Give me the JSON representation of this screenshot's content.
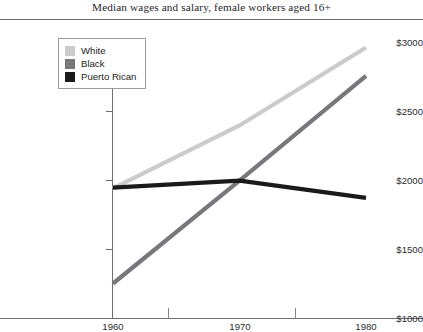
{
  "chart_data": {
    "type": "line",
    "title": "Median wages and salary, female workers aged 16+",
    "xlabel": "",
    "ylabel": "",
    "x": [
      1960,
      1970,
      1980
    ],
    "xticklabels": [
      "1960",
      "1970",
      "1980"
    ],
    "yticklabels": [
      "$1000",
      "$1500",
      "$2000",
      "$2500",
      "$3000"
    ],
    "yticks": [
      1000,
      1500,
      2000,
      2500,
      3000
    ],
    "xlim": [
      1960,
      1980
    ],
    "ylim": [
      1000,
      3000
    ],
    "grid": false,
    "legend_position": "upper left",
    "series": [
      {
        "name": "White",
        "color": "#cbcbcb",
        "values": [
          1940,
          2395,
          2960
        ]
      },
      {
        "name": "Black",
        "color": "#77777c",
        "values": [
          1250,
          1995,
          2755
        ]
      },
      {
        "name": "Puerto Rican",
        "color": "#1a1a1a",
        "values": [
          1945,
          1995,
          1870
        ]
      }
    ]
  },
  "legend": {
    "entries": [
      {
        "label": "White",
        "color": "#cbcbcb"
      },
      {
        "label": "Black",
        "color": "#77777c"
      },
      {
        "label": "Puerto Rican",
        "color": "#1a1a1a"
      }
    ]
  },
  "axes": {
    "y_labels": [
      "$3000",
      "$2500",
      "$2000",
      "$1500",
      "$1000"
    ],
    "x_labels": [
      "1960",
      "1970",
      "1980"
    ]
  }
}
